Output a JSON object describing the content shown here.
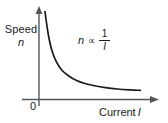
{
  "figure": {
    "origin_label": "0",
    "annotation": {
      "lhs": "n",
      "operator": "∝",
      "numerator": "1",
      "denominator": "I"
    },
    "y_axis": {
      "name": "Speed",
      "symbol": "n"
    },
    "x_axis": {
      "name": "Current",
      "symbol": "I"
    }
  },
  "chart_data": {
    "type": "line",
    "title": "",
    "subtitle": "",
    "xlabel": "Current I",
    "ylabel": "Speed n",
    "annotations": [
      "n ∝ 1/I"
    ],
    "legend": [],
    "legend_position": "none",
    "grid": false,
    "axis_arrows": true,
    "tick_labels": {
      "x": [
        "0"
      ],
      "y": []
    },
    "xlim": [
      0,
      10
    ],
    "ylim": [
      0,
      10
    ],
    "relation": "n = k / I",
    "series": [
      {
        "name": "n ∝ 1/I",
        "color": "#1a1a1a",
        "x": [
          0.55,
          0.7,
          0.9,
          1.2,
          1.6,
          2.1,
          2.7,
          3.4,
          4.2,
          5.1,
          6.1,
          7.2,
          8.4,
          9.3
        ],
        "y": [
          9.6,
          8.3,
          6.8,
          5.3,
          4.1,
          3.2,
          2.6,
          2.1,
          1.75,
          1.5,
          1.3,
          1.15,
          1.05,
          1.0
        ]
      }
    ]
  }
}
